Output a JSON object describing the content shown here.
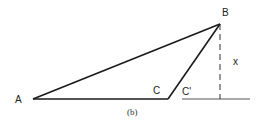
{
  "diagram": {
    "caption": "(b)",
    "vertices": {
      "A": {
        "label": "A",
        "x": 33,
        "y": 99
      },
      "B": {
        "label": "B",
        "x": 220,
        "y": 24
      },
      "C": {
        "label": "C",
        "x": 168,
        "y": 99
      }
    },
    "labels": {
      "A": "A",
      "B": "B",
      "C": "C",
      "C_prime": "C'",
      "x": "x"
    },
    "edges": [
      {
        "from": "A",
        "to": "B",
        "style": "solid"
      },
      {
        "from": "A",
        "to": "C",
        "style": "solid"
      },
      {
        "from": "C",
        "to": "B",
        "style": "solid"
      }
    ],
    "height_line": {
      "from": [
        220,
        24
      ],
      "to": [
        220,
        99
      ],
      "style": "dashed",
      "label": "x"
    },
    "ground_line": {
      "from": [
        182,
        99
      ],
      "to": [
        250,
        99
      ],
      "style": "solid"
    },
    "colors": {
      "stroke": "#1a1a1a",
      "dashed": "#333333",
      "ground": "#555555"
    }
  }
}
